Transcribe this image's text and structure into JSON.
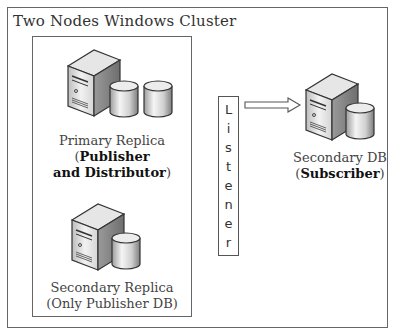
{
  "diagram": {
    "title": "Two Nodes Windows Cluster",
    "nodes": [
      {
        "id": "primary",
        "name": "Primary Replica",
        "role_open": "(",
        "role_line1": "Publisher",
        "role_line2": "and Distributor",
        "role_close": ")",
        "icon": "server-with-two-databases-icon"
      },
      {
        "id": "secondary",
        "name": "Secondary Replica",
        "role": "(Only Publisher DB)",
        "icon": "server-with-database-icon"
      },
      {
        "id": "subscriber",
        "name": "Secondary DB",
        "role_open": "(",
        "role": "Subscriber",
        "role_close": ")",
        "icon": "server-with-database-icon"
      }
    ],
    "listener": {
      "label": "Listener",
      "letters": [
        "L",
        "i",
        "s",
        "t",
        "e",
        "n",
        "e",
        "r"
      ]
    },
    "edges": [
      {
        "from": "listener",
        "to": "subscriber",
        "style": "hollow-arrow"
      }
    ]
  }
}
